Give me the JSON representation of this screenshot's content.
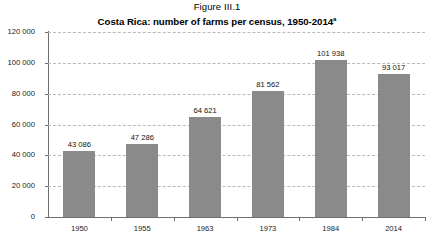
{
  "figure": {
    "number": "Figure III.1",
    "title": "Costa Rica: number of farms per census, 1950-2014",
    "title_superscript": "a"
  },
  "chart_data": {
    "type": "bar",
    "title": "Costa Rica: number of farms per census, 1950-2014",
    "xlabel": "",
    "ylabel": "",
    "categories": [
      "1950",
      "1955",
      "1963",
      "1973",
      "1984",
      "2014"
    ],
    "values": [
      43086,
      47286,
      64621,
      81562,
      101938,
      93017
    ],
    "value_labels": [
      "43 086",
      "47 286",
      "64 621",
      "81 562",
      "101 938",
      "93 017"
    ],
    "ylim": [
      0,
      120000
    ],
    "ytick_values": [
      0,
      20000,
      40000,
      60000,
      80000,
      100000,
      120000
    ],
    "ytick_labels": [
      "0",
      "20 000",
      "40 000",
      "60 000",
      "80 000",
      "100 000",
      "120 000"
    ],
    "grid": true,
    "legend": false,
    "bar_color": "#8a8a8a",
    "gridline_color": "#b9b9b9",
    "axis_color": "#6f6f6f"
  }
}
